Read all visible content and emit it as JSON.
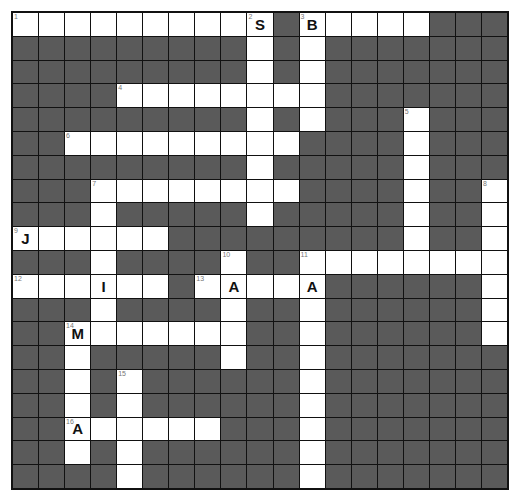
{
  "puzzle": {
    "cols": 19,
    "rows": 20,
    "colors": {
      "block": "#5a5a5a",
      "open": "#ffffff",
      "border": "#111111"
    },
    "grid": [
      "..........#.....###",
      "#########.#.#######",
      "#########.#.#######",
      "####........#######",
      "#########.#.###.###",
      "##.........####.###",
      "#########.#####.###",
      "###........####.##.",
      "###.#####.#####.##.",
      "......#########.##.",
      "###.####.##........",
      "......#.....######.",
      "###.####.##.######.",
      "##.......##.######.",
      "##.#####.##.#######",
      "##.#.######.#######",
      "##.#.######.#######",
      "##......###.#######",
      "##.#.######.#######",
      "####.######.#######"
    ],
    "numbers": [
      {
        "row": 0,
        "col": 0,
        "n": "1"
      },
      {
        "row": 0,
        "col": 9,
        "n": "2"
      },
      {
        "row": 0,
        "col": 11,
        "n": "3"
      },
      {
        "row": 3,
        "col": 4,
        "n": "4"
      },
      {
        "row": 4,
        "col": 15,
        "n": "5"
      },
      {
        "row": 5,
        "col": 2,
        "n": "6"
      },
      {
        "row": 7,
        "col": 3,
        "n": "7"
      },
      {
        "row": 7,
        "col": 18,
        "n": "8"
      },
      {
        "row": 9,
        "col": 0,
        "n": "9"
      },
      {
        "row": 10,
        "col": 8,
        "n": "10"
      },
      {
        "row": 10,
        "col": 11,
        "n": "11"
      },
      {
        "row": 11,
        "col": 0,
        "n": "12"
      },
      {
        "row": 11,
        "col": 7,
        "n": "13"
      },
      {
        "row": 13,
        "col": 2,
        "n": "14"
      },
      {
        "row": 15,
        "col": 4,
        "n": "15"
      },
      {
        "row": 17,
        "col": 2,
        "n": "16"
      }
    ],
    "letters": [
      {
        "row": 0,
        "col": 9,
        "ch": "S"
      },
      {
        "row": 0,
        "col": 11,
        "ch": "B"
      },
      {
        "row": 9,
        "col": 0,
        "ch": "J"
      },
      {
        "row": 11,
        "col": 3,
        "ch": "I"
      },
      {
        "row": 11,
        "col": 8,
        "ch": "A"
      },
      {
        "row": 11,
        "col": 11,
        "ch": "A"
      },
      {
        "row": 13,
        "col": 2,
        "ch": "M"
      },
      {
        "row": 17,
        "col": 2,
        "ch": "A"
      }
    ]
  }
}
